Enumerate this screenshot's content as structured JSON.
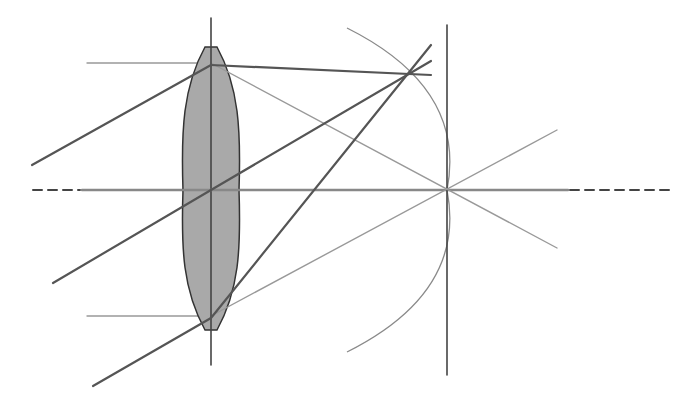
{
  "colors": {
    "background": "#ffffff",
    "lens_fill": "#a9a9a9",
    "lens_outline": "#333333",
    "dark_ray": "#555555",
    "light_ray": "#999999",
    "axis_solid": "#888888",
    "axis_dash": "#444444",
    "vertical_line": "#444444",
    "arc": "#8a8a8a"
  },
  "optical_axis": {
    "y": 190,
    "dash_left": {
      "x1": 33,
      "x2": 80
    },
    "solid": {
      "x1": 82,
      "x2": 568
    },
    "dash_right": {
      "x1": 570,
      "x2": 672
    }
  },
  "lens": {
    "center_x": 211,
    "center_y": 190,
    "top_y": 47,
    "bottom_y": 330,
    "half_width": 28,
    "axis_line": {
      "y1": 18,
      "y2": 365
    }
  },
  "focal_plane": {
    "x": 447,
    "y1": 25,
    "y2": 375
  },
  "focal_point": {
    "x": 447,
    "y": 190
  },
  "image_point": {
    "x": 407,
    "y": 74
  },
  "arc": {
    "start": [
      347,
      28
    ],
    "through": [
      447,
      190
    ],
    "end": [
      347,
      352
    ]
  },
  "oblique_rays": [
    {
      "name": "upper-oblique-ray",
      "in": [
        32,
        165
      ],
      "lens": [
        211,
        65
      ],
      "out": [
        431,
        75
      ]
    },
    {
      "name": "chief-ray",
      "in": [
        53,
        283
      ],
      "lens": [
        211,
        190
      ],
      "out": [
        431,
        61
      ]
    },
    {
      "name": "lower-oblique-ray",
      "in": [
        93,
        386
      ],
      "lens": [
        211,
        318
      ],
      "out": [
        431,
        45
      ]
    }
  ],
  "parallel_rays": [
    {
      "name": "upper-parallel-ray",
      "in": [
        87,
        63
      ],
      "lens": [
        211,
        63
      ],
      "out": [
        557,
        248
      ]
    },
    {
      "name": "lower-parallel-ray",
      "in": [
        87,
        316
      ],
      "lens": [
        211,
        316
      ],
      "out": [
        557,
        130
      ]
    }
  ]
}
